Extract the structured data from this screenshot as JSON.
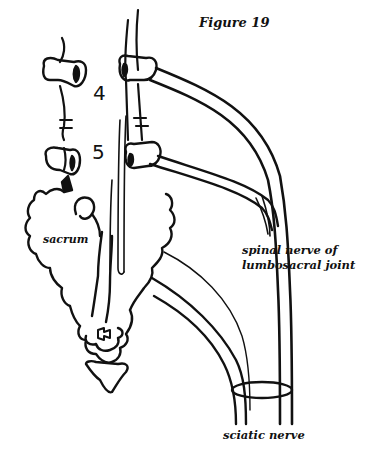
{
  "figure": {
    "title": "Figure 19",
    "labels": {
      "sacrum": "sacrum",
      "spinal_nerve_line1": "spinal nerve of",
      "spinal_nerve_line2": "lumbosacral joint",
      "sciatic_nerve": "sciatic nerve"
    },
    "vertebra_numbers": {
      "l4": "4",
      "l5": "5"
    },
    "colors": {
      "ink": "#111111",
      "background": "#ffffff"
    }
  }
}
